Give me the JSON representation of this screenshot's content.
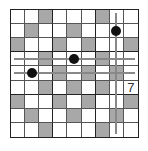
{
  "puzzle": {
    "size": 9,
    "colors": {
      "shaded": "#a8a8a8",
      "empty": "#ffffff",
      "dot": "#111111",
      "line": "#888888"
    },
    "shaded_cells": [
      [
        1,
        3
      ],
      [
        1,
        7
      ],
      [
        2,
        2
      ],
      [
        2,
        5
      ],
      [
        3,
        1
      ],
      [
        3,
        4
      ],
      [
        3,
        6
      ],
      [
        3,
        9
      ],
      [
        4,
        3
      ],
      [
        4,
        7
      ],
      [
        5,
        4
      ],
      [
        5,
        6
      ],
      [
        5,
        8
      ],
      [
        6,
        3
      ],
      [
        6,
        5
      ],
      [
        6,
        7
      ],
      [
        7,
        1
      ],
      [
        7,
        4
      ],
      [
        7,
        6
      ],
      [
        7,
        9
      ],
      [
        8,
        2
      ],
      [
        8,
        5
      ],
      [
        8,
        8
      ],
      [
        9,
        3
      ],
      [
        9,
        7
      ]
    ],
    "dots": [
      [
        2,
        8
      ],
      [
        4,
        5
      ],
      [
        5,
        2
      ]
    ],
    "numbers": [
      {
        "row": 6,
        "col": 9,
        "value": "7"
      }
    ],
    "lines": {
      "horizontal_rows": [
        4,
        5
      ],
      "vertical_cols": [
        8
      ]
    }
  }
}
